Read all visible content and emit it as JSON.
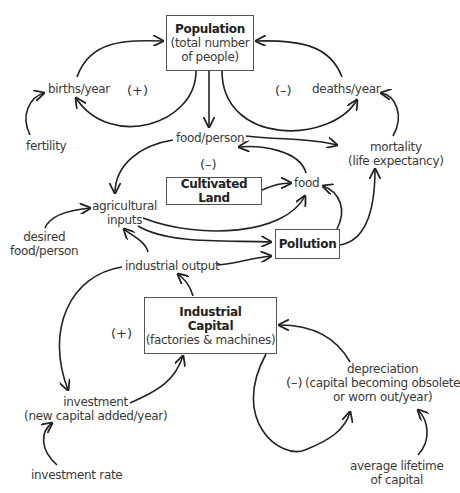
{
  "stocks": {
    "population": {
      "title": "Population",
      "sub1": "(total number",
      "sub2": "of people)"
    },
    "cultivated_land": {
      "title": "Cultivated Land"
    },
    "pollution": {
      "title": "Pollution"
    },
    "industrial_capital": {
      "title1": "Industrial",
      "title2": "Capital",
      "sub": "(factories & machines)"
    }
  },
  "variables": {
    "births": "births/year",
    "deaths": "deaths/year",
    "fertility": "fertility",
    "food_person": "food/person",
    "mortality1": "mortality",
    "mortality2": "(life expectancy)",
    "food": "food",
    "agri1": "agricultural",
    "agri2": "inputs",
    "desired1": "desired",
    "desired2": "food/person",
    "industrial_output": "industrial output",
    "investment1": "investment",
    "investment2": "(new capital added/year)",
    "investment_rate": "investment rate",
    "depreciation1": "depreciation",
    "depreciation2": "(capital becoming obsolete",
    "depreciation3": "or worn out/year)",
    "lifetime1": "average lifetime",
    "lifetime2": "of capital"
  },
  "loop_signs": {
    "births_loop": "(+)",
    "deaths_loop": "(–)",
    "food_loop": "(–)",
    "investment_loop": "(+)",
    "depreciation_loop": "(–)"
  }
}
